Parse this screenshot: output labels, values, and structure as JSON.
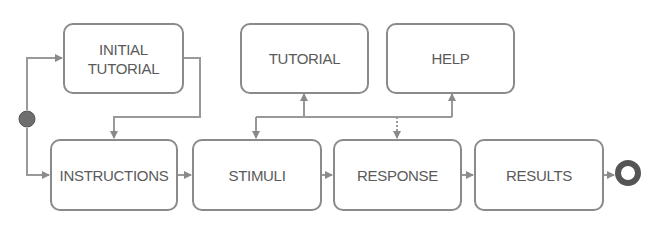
{
  "diagram": {
    "type": "state-flow",
    "nodes": {
      "initial_tutorial": "INITIAL\nTUTORIAL",
      "instructions": "INSTRUCTIONS",
      "stimuli": "STIMULI",
      "response": "RESPONSE",
      "results": "RESULTS",
      "tutorial": "TUTORIAL",
      "help": "HELP"
    },
    "start_marker": "filled-circle",
    "end_marker": "ring",
    "edges": [
      {
        "from": "start",
        "to": "initial_tutorial"
      },
      {
        "from": "start",
        "to": "instructions"
      },
      {
        "from": "initial_tutorial",
        "to": "instructions"
      },
      {
        "from": "instructions",
        "to": "stimuli"
      },
      {
        "from": "stimuli",
        "to": "response"
      },
      {
        "from": "response",
        "to": "results"
      },
      {
        "from": "results",
        "to": "end"
      },
      {
        "from": "stimuli",
        "to": "tutorial"
      },
      {
        "from": "stimuli",
        "to": "help"
      },
      {
        "from": "tutorial",
        "to": "stimuli"
      },
      {
        "from": "help",
        "to": "response"
      }
    ],
    "colors": {
      "border": "#8a8a8a",
      "text": "#5a5a5a",
      "start_fill": "#6e6e6e",
      "end_fill": "#555555"
    }
  }
}
